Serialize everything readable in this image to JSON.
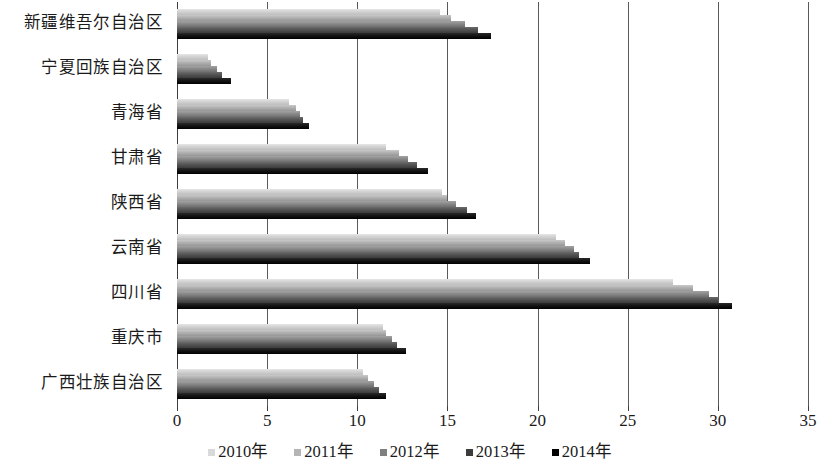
{
  "chart_data": {
    "type": "bar",
    "orientation": "horizontal",
    "title": "",
    "subtitle": "",
    "xlabel": "",
    "ylabel": "",
    "xlim": [
      0,
      35
    ],
    "xticks": [
      0,
      5,
      10,
      15,
      20,
      25,
      30,
      35
    ],
    "xtick_labels": [
      "0",
      "5",
      "10",
      "15",
      "20",
      "25",
      "30",
      "35"
    ],
    "grid": "vertical",
    "legend_position": "bottom",
    "categories": [
      "新疆维吾尔自治区",
      "宁夏回族自治区",
      "青海省",
      "甘肃省",
      "陕西省",
      "云南省",
      "四川省",
      "重庆市",
      "广西壮族自治区"
    ],
    "series": [
      {
        "name": "2010年",
        "color": "#d9d9d9",
        "values": [
          14.6,
          1.7,
          6.2,
          11.6,
          14.7,
          21.0,
          27.5,
          11.4,
          10.3
        ]
      },
      {
        "name": "2011年",
        "color": "#b5b5b5",
        "values": [
          15.2,
          1.9,
          6.6,
          12.3,
          15.0,
          21.5,
          28.6,
          11.6,
          10.6
        ]
      },
      {
        "name": "2012年",
        "color": "#7f7f7f",
        "values": [
          16.0,
          2.2,
          6.8,
          12.8,
          15.5,
          22.0,
          29.5,
          11.9,
          10.9
        ]
      },
      {
        "name": "2013年",
        "color": "#3c3c3c",
        "values": [
          16.7,
          2.5,
          7.0,
          13.3,
          16.1,
          22.3,
          30.0,
          12.2,
          11.2
        ]
      },
      {
        "name": "2014年",
        "color": "#000000",
        "values": [
          17.4,
          3.0,
          7.3,
          13.9,
          16.6,
          22.9,
          30.8,
          12.7,
          11.6
        ]
      }
    ]
  }
}
